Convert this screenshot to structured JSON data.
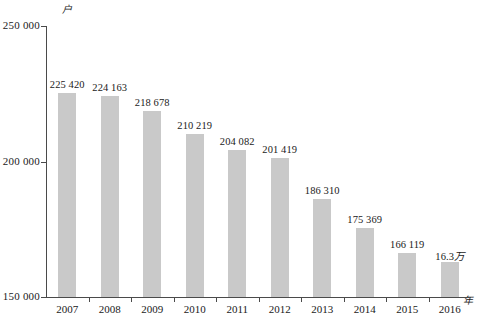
{
  "chart_data": {
    "type": "bar",
    "title": "",
    "subtitle": "",
    "xlabel": "年",
    "ylabel": "户",
    "categories": [
      "2007",
      "2008",
      "2009",
      "2010",
      "2011",
      "2012",
      "2013",
      "2014",
      "2015",
      "2016"
    ],
    "values": [
      225420,
      224163,
      218678,
      210219,
      204082,
      201419,
      186310,
      175369,
      166119,
      163000
    ],
    "value_labels": [
      "225 420",
      "224 163",
      "218 678",
      "210 219",
      "204 082",
      "201 419",
      "186 310",
      "175 369",
      "166 119",
      "16.3万"
    ],
    "ylim": [
      150000,
      250000
    ],
    "yticks": [
      150000,
      200000,
      250000
    ],
    "ytick_labels": [
      "150 000",
      "200 000",
      "250 000"
    ],
    "grid": false,
    "legend": null,
    "bar_color": "#c9c9c9",
    "axis_color": "#4a4a4a"
  },
  "axes": {
    "y_unit": "户",
    "x_unit": "年"
  },
  "caption": {
    "text": ""
  }
}
